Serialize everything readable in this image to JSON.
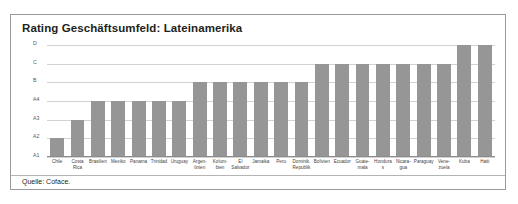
{
  "panel": {
    "title": "Rating Geschäftsumfeld: Lateinamerika",
    "source": "Quelle: Coface."
  },
  "chart_data": {
    "type": "bar",
    "title": "Rating Geschäftsumfeld: Lateinamerika",
    "xlabel": "",
    "ylabel": "",
    "grid": true,
    "legend": null,
    "y_scale": "ordinal",
    "y_ticks": [
      "A1",
      "A2",
      "A3",
      "A4",
      "B",
      "C",
      "D"
    ],
    "ylim": [
      "A1",
      "D"
    ],
    "categories": [
      "Chile",
      "Costa Rica",
      "Brasilien",
      "Mexiko",
      "Panama",
      "Trinidad",
      "Uruguay",
      "Argentinien",
      "Kolumbien",
      "El Salvador",
      "Jamaika",
      "Peru",
      "Dominik. Republik",
      "Bolivien",
      "Ecuador",
      "Guatemala",
      "Honduras",
      "Nicaragua",
      "Paraguay",
      "Venezuela",
      "Kuba",
      "Haiti"
    ],
    "category_lines": [
      [
        "Chile"
      ],
      [
        "Costa",
        "Rica"
      ],
      [
        "Brasilien"
      ],
      [
        "Mexiko"
      ],
      [
        "Panama"
      ],
      [
        "Trinidad"
      ],
      [
        "Uruguay"
      ],
      [
        "Argen-",
        "tinien"
      ],
      [
        "Kolum-",
        "bien"
      ],
      [
        "El",
        "Salvador"
      ],
      [
        "Jamaika"
      ],
      [
        "Peru"
      ],
      [
        "Dominik.",
        "Republik"
      ],
      [
        "Bolivien"
      ],
      [
        "Ecuador"
      ],
      [
        "Guate-",
        "mala"
      ],
      [
        "Honduras"
      ],
      [
        "Nicara-",
        "gua"
      ],
      [
        "Paraguay"
      ],
      [
        "Vene-",
        "zuela"
      ],
      [
        "Kuba"
      ],
      [
        "Haiti"
      ]
    ],
    "values": [
      "A2",
      "A3",
      "A4",
      "A4",
      "A4",
      "A4",
      "A4",
      "B",
      "B",
      "B",
      "B",
      "B",
      "B",
      "C",
      "C",
      "C",
      "C",
      "C",
      "C",
      "C",
      "D",
      "D"
    ],
    "values_numeric": [
      2,
      3,
      4,
      4,
      4,
      4,
      4,
      5,
      5,
      5,
      5,
      5,
      5,
      6,
      6,
      6,
      6,
      6,
      6,
      6,
      7,
      7
    ]
  },
  "colors": {
    "bar": "#969696",
    "grid": "#d2d2d2",
    "border": "#9a9a9a",
    "text": "#231f20"
  }
}
